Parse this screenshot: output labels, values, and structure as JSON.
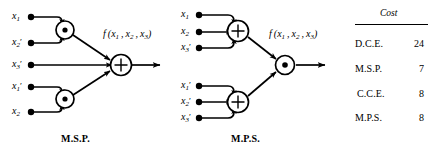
{
  "figure": {
    "title": "",
    "background": "#ffffff",
    "ink": "#000000"
  },
  "diagrams": [
    {
      "id": "msp",
      "caption": "M.S.P.",
      "output_label": "f (x1 , x2 , x3)",
      "output_label_parts": {
        "f": "f",
        "open": "(",
        "a": "x",
        "a_sub": "1",
        "b": "x",
        "b_sub": "2",
        "c": "x",
        "c_sub": "3",
        "close": ")"
      },
      "inputs": [
        {
          "base": "x",
          "sub": "1",
          "prime": ""
        },
        {
          "base": "x",
          "sub": "2",
          "prime": "′"
        },
        {
          "base": "x",
          "sub": "3",
          "prime": "′"
        },
        {
          "base": "x",
          "sub": "1",
          "prime": "′"
        },
        {
          "base": "x",
          "sub": "2",
          "prime": ""
        }
      ],
      "gates": [
        {
          "name": "product-gate-top",
          "symbol": "dot"
        },
        {
          "name": "product-gate-bottom",
          "symbol": "dot"
        },
        {
          "name": "sum-gate-output",
          "symbol": "plus"
        }
      ]
    },
    {
      "id": "mps",
      "caption": "M.P.S.",
      "output_label": "f (x1 , x2 , x3)",
      "output_label_parts": {
        "f": "f",
        "open": "(",
        "a": "x",
        "a_sub": "1",
        "b": "x",
        "b_sub": "2",
        "c": "x",
        "c_sub": "3",
        "close": ")"
      },
      "inputs": [
        {
          "base": "x",
          "sub": "1",
          "prime": ""
        },
        {
          "base": "x",
          "sub": "2",
          "prime": ""
        },
        {
          "base": "x",
          "sub": "3",
          "prime": "′"
        },
        {
          "base": "x",
          "sub": "1",
          "prime": "′"
        },
        {
          "base": "x",
          "sub": "2",
          "prime": "′"
        },
        {
          "base": "x",
          "sub": "3",
          "prime": "′"
        }
      ],
      "gates": [
        {
          "name": "sum-gate-top",
          "symbol": "plus"
        },
        {
          "name": "sum-gate-bottom",
          "symbol": "plus"
        },
        {
          "name": "product-gate-output",
          "symbol": "dot"
        }
      ]
    }
  ],
  "cost_table": {
    "header": "Cost",
    "rows": [
      {
        "name": "D.C.E.",
        "cost": "24"
      },
      {
        "name": "M.S.P.",
        "cost": "7"
      },
      {
        "name": "C.C.E.",
        "cost": "8"
      },
      {
        "name": "M.P.S.",
        "cost": "8"
      }
    ]
  }
}
